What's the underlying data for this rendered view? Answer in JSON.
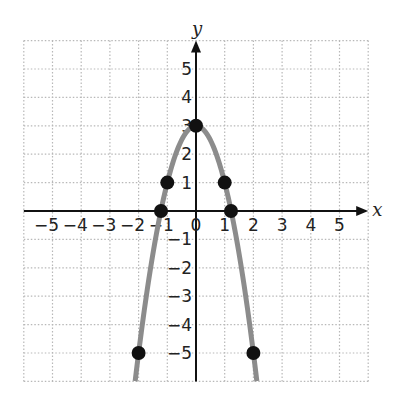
{
  "chart_data": {
    "type": "line",
    "title": "",
    "xlabel": "x",
    "ylabel": "y",
    "xlim": [
      -6,
      6
    ],
    "ylim": [
      -6,
      6
    ],
    "grid": true,
    "legend": null,
    "x_ticks": [
      -5,
      -4,
      -3,
      -2,
      -1,
      0,
      1,
      2,
      3,
      4,
      5
    ],
    "x_tick_labels": [
      "−5",
      "−4",
      "−3",
      "−2",
      "−1",
      "0",
      "1",
      "2",
      "3",
      "4",
      "5"
    ],
    "y_ticks": [
      5,
      4,
      3,
      2,
      1,
      -1,
      -2,
      -3,
      -4,
      -5
    ],
    "y_tick_labels": [
      "5",
      "4",
      "3",
      "2",
      "1",
      "−1",
      "−2",
      "−3",
      "−4",
      "−5"
    ],
    "series": [
      {
        "name": "y = 3 − 2x²",
        "kind": "curve",
        "color": "#8c8c8c",
        "x_range": [
          -2.12,
          2.12
        ],
        "equation": "y = 3 - 2x^2"
      },
      {
        "name": "plotted points",
        "kind": "scatter",
        "color": "#111111",
        "points": [
          {
            "x": -2,
            "y": -5
          },
          {
            "x": -1.22,
            "y": 0
          },
          {
            "x": -1,
            "y": 1
          },
          {
            "x": 0,
            "y": 3
          },
          {
            "x": 1,
            "y": 1
          },
          {
            "x": 1.22,
            "y": 0
          },
          {
            "x": 2,
            "y": -5
          }
        ]
      }
    ]
  },
  "colors": {
    "axis": "#111111",
    "grid": "#b8b8b8",
    "curve": "#8c8c8c",
    "points": "#111111"
  }
}
